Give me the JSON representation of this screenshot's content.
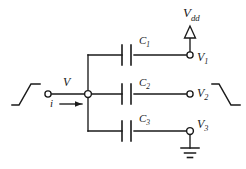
{
  "diagram": {
    "background_color": "#ffffff",
    "line_color": "#1a1a1a",
    "labels": {
      "supply": {
        "base": "V",
        "sub": "dd"
      },
      "node_voltage": {
        "base": "V",
        "sub": ""
      },
      "current": {
        "base": "i",
        "sub": ""
      },
      "cap1": {
        "base": "C",
        "sub": "1"
      },
      "cap2": {
        "base": "C",
        "sub": "2"
      },
      "cap3": {
        "base": "C",
        "sub": "3"
      },
      "out1": {
        "base": "V",
        "sub": "1"
      },
      "out2": {
        "base": "V",
        "sub": "2"
      },
      "out3": {
        "base": "V",
        "sub": "3"
      }
    },
    "components": [
      {
        "name": "capacitor-c1",
        "type": "capacitor",
        "label": "C1",
        "branch": "top"
      },
      {
        "name": "capacitor-c2",
        "type": "capacitor",
        "label": "C2",
        "branch": "middle"
      },
      {
        "name": "capacitor-c3",
        "type": "capacitor",
        "label": "C3",
        "branch": "bottom"
      },
      {
        "name": "supply-triangle",
        "type": "supply",
        "label": "Vdd"
      },
      {
        "name": "ground-symbol",
        "type": "ground",
        "label": ""
      }
    ],
    "terminals": [
      {
        "name": "input-terminal",
        "label": ""
      },
      {
        "name": "junction-node",
        "label": ""
      },
      {
        "name": "terminal-v1",
        "label": "V1"
      },
      {
        "name": "terminal-v2",
        "label": "V2"
      },
      {
        "name": "terminal-v3",
        "label": "V3"
      }
    ],
    "waveforms": [
      {
        "name": "input-waveform-rising",
        "shape": "rising-step"
      },
      {
        "name": "output-waveform-falling",
        "shape": "falling-step"
      }
    ]
  }
}
